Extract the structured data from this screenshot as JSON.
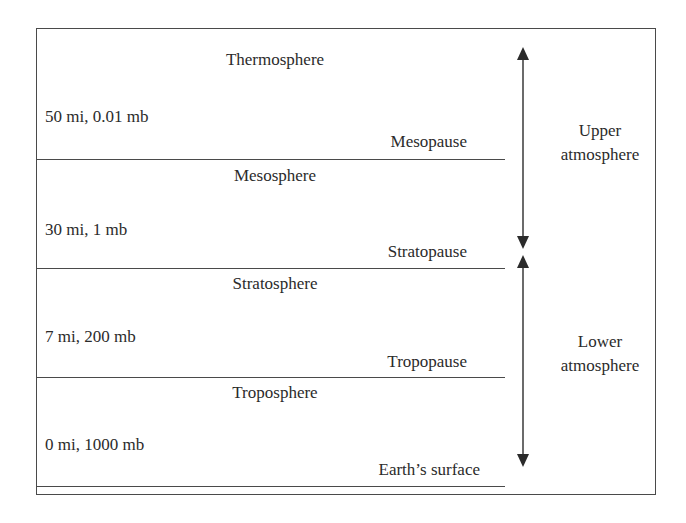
{
  "diagram": {
    "title": "",
    "layers": [
      {
        "name": "Thermosphere"
      },
      {
        "name": "Mesosphere"
      },
      {
        "name": "Stratosphere"
      },
      {
        "name": "Troposphere"
      }
    ],
    "boundaries": [
      {
        "name": "Mesopause",
        "altitude_pressure": "50 mi, 0.01 mb"
      },
      {
        "name": "Stratopause",
        "altitude_pressure": "30 mi, 1 mb"
      },
      {
        "name": "Tropopause",
        "altitude_pressure": "7 mi, 200 mb"
      },
      {
        "name": "Earth’s surface",
        "altitude_pressure": "0 mi, 1000 mb"
      }
    ],
    "regions": [
      {
        "line1": "Upper",
        "line2": "atmosphere",
        "spans": "Thermosphere to Stratopause"
      },
      {
        "line1": "Lower",
        "line2": "atmosphere",
        "spans": "Stratosphere to Earth’s surface"
      }
    ],
    "colors": {
      "line": "#4a4a4a",
      "text": "#2b2b2b",
      "background": "#ffffff"
    }
  }
}
